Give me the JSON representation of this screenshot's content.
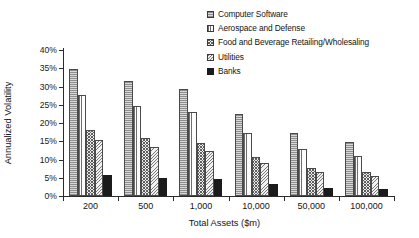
{
  "chart_data": {
    "type": "bar",
    "title": "",
    "subtitle": "",
    "xlabel": "Total Assets ($m)",
    "ylabel": "Annualized Volatility",
    "categories": [
      "200",
      "500",
      "1,000",
      "10,000",
      "50,000",
      "100,000"
    ],
    "ylim": [
      0,
      40
    ],
    "ytick_labels": [
      "0%",
      "5%",
      "10%",
      "15%",
      "20%",
      "25%",
      "30%",
      "35%",
      "40%"
    ],
    "ytick_values": [
      0,
      5,
      10,
      15,
      20,
      25,
      30,
      35,
      40
    ],
    "ytick_suffix": "%",
    "grid": false,
    "legend_position": "top-right",
    "series": [
      {
        "name": "Computer Software",
        "pattern": "horizontal-lines",
        "color": "#d9d9d9",
        "values": [
          34.8,
          31.5,
          29.4,
          22.6,
          17.2,
          14.8
        ]
      },
      {
        "name": "Aerospace and Defense",
        "pattern": "vertical-lines",
        "color": "#fdfdfd",
        "values": [
          27.6,
          24.7,
          22.9,
          17.3,
          12.8,
          11.0
        ]
      },
      {
        "name": "Food and Beverage Retailing/Wholesaling",
        "pattern": "cross-hatch",
        "color": "#ececec",
        "values": [
          18.0,
          15.8,
          14.6,
          10.7,
          7.8,
          6.5
        ]
      },
      {
        "name": "Utilities",
        "pattern": "diagonal-hatch",
        "color": "#f1f1f1",
        "values": [
          15.3,
          13.4,
          12.4,
          9.0,
          6.6,
          5.5
        ]
      },
      {
        "name": "Banks",
        "pattern": "solid",
        "color": "#1b1b1b",
        "values": [
          5.8,
          5.0,
          4.6,
          3.2,
          2.2,
          2.0
        ]
      }
    ]
  }
}
